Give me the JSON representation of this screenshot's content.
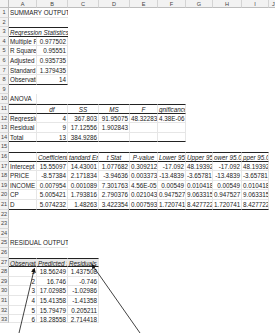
{
  "columns": [
    "A",
    "B",
    "C",
    "D",
    "E",
    "F",
    "G",
    "H",
    "I",
    "J"
  ],
  "row_numbers": [
    "1",
    "2",
    "3",
    "4",
    "5",
    "6",
    "7",
    "8",
    "9",
    "10",
    "11",
    "12",
    "13",
    "14",
    "15",
    "16",
    "17",
    "18",
    "19",
    "20",
    "21",
    "22",
    "23",
    "24",
    "25",
    "26",
    "27",
    "28",
    "29",
    "30",
    "31",
    "32",
    "33"
  ],
  "summary": {
    "title": "SUMMARY OUTPUT",
    "reg_stats_header": "Regression Statistics",
    "stats": [
      {
        "label": "Multiple F",
        "value": "0.977502"
      },
      {
        "label": "R Square",
        "value": "0.95551"
      },
      {
        "label": "Adjusted I",
        "value": "0.935735"
      },
      {
        "label": "Standard I",
        "value": "1.379435"
      },
      {
        "label": "Observati",
        "value": "14"
      }
    ]
  },
  "anova": {
    "title": "ANOVA",
    "headers": [
      "",
      "df",
      "SS",
      "MS",
      "F",
      "gnificance F"
    ],
    "rows": [
      [
        "Regressio",
        "4",
        "367.803",
        "91.95075",
        "48.32283",
        "4.38E-06"
      ],
      [
        "Residual",
        "9",
        "17.12556",
        "1.902843",
        "",
        ""
      ],
      [
        "Total",
        "13",
        "384.9286",
        "",
        "",
        ""
      ]
    ]
  },
  "coefficients": {
    "headers": [
      "",
      "Coefficients",
      "tandard Err",
      "t Stat",
      "P-value",
      "Lower 95%",
      "Upper 95%",
      "ower 95.0%",
      "pper 95.0%"
    ],
    "rows": [
      [
        "Intercept",
        "15.55097",
        "14.43001",
        "1.077682",
        "0.309212",
        "-17.092",
        "48.19392",
        "-17.092",
        "48.19392"
      ],
      [
        "PRICE",
        "-8.57384",
        "2.171834",
        "-3.94636",
        "0.003373",
        "-13.4839",
        "-3.65781",
        "-13.4839",
        "-3.65781"
      ],
      [
        "INCOME",
        "0.007954",
        "0.001089",
        "7.301763",
        "4.56E-05",
        "0.00549",
        "0.010418",
        "0.00549",
        "0.010418"
      ],
      [
        "CP",
        "5.005421",
        "1.793816",
        "2.790376",
        "0.021043",
        "0.947527",
        "9.063315",
        "0.947527",
        "9.063315"
      ],
      [
        "D",
        "5.074232",
        "1.48263",
        "3.422354",
        "0.007593",
        "1.720741",
        "8.427722",
        "1.720741",
        "8.427722"
      ]
    ]
  },
  "residuals": {
    "title": "RESIDUAL OUTPUT",
    "headers": [
      "Observation",
      "Predicted SAL",
      "Residuals"
    ],
    "rows": [
      [
        "1",
        "18.56249",
        "1.437508"
      ],
      [
        "2",
        "16.746",
        "-0.746"
      ],
      [
        "3",
        "17.02985",
        "-1.02986"
      ],
      [
        "4",
        "15.41358",
        "-1.41358"
      ],
      [
        "5",
        "15.79479",
        "0.205211"
      ],
      [
        "6",
        "18.28558",
        "2.714418"
      ]
    ]
  },
  "annotation": {
    "arrow_color": "#111111"
  }
}
